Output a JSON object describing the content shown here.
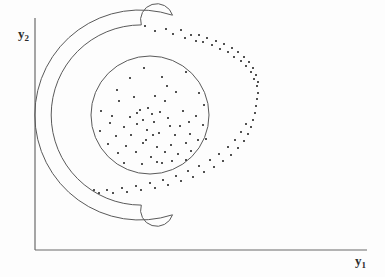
{
  "figure": {
    "background_color": "#fdfdfd",
    "line_color": "#4a4a4a",
    "point_color": "#2a2a2a"
  },
  "axes": {
    "y_axis_label": "y",
    "y_axis_subscript": "2",
    "x_axis_label": "y",
    "x_axis_subscript": "1",
    "x_axis": {
      "x1": 35,
      "y1": 250,
      "x2": 367,
      "y2": 250
    },
    "y_axis": {
      "x1": 35,
      "y1": 18,
      "x2": 35,
      "y2": 250
    }
  },
  "chart_data": {
    "type": "scatter",
    "title": "",
    "xlabel": "y1",
    "ylabel": "y2",
    "grid": false,
    "legend": "none",
    "xlim": [
      35,
      367
    ],
    "ylim": [
      18,
      250
    ],
    "annotations": [
      {
        "name": "inner-circle-boundary",
        "shape": "circle",
        "cx": 150,
        "cy": 115,
        "r": 59
      },
      {
        "name": "crescent-outer-boundary",
        "shape": "c-shape-band",
        "cx": 150,
        "cy": 115,
        "r_inner": 73,
        "r_outer": 105,
        "start_angle_deg": -72,
        "end_angle_deg": 72,
        "opening": "left"
      }
    ],
    "series": [
      {
        "name": "cluster-1-disk",
        "marker": "dot",
        "points": [
          [
            144,
            68
          ],
          [
            130,
            78
          ],
          [
            162,
            77
          ],
          [
            167,
            86
          ],
          [
            186,
            72
          ],
          [
            117,
            90
          ],
          [
            176,
            92
          ],
          [
            199,
            93
          ],
          [
            155,
            96
          ],
          [
            204,
            105
          ],
          [
            140,
            110
          ],
          [
            119,
            101
          ],
          [
            101,
            111
          ],
          [
            137,
            113
          ],
          [
            148,
            108
          ],
          [
            152,
            114
          ],
          [
            160,
            112
          ],
          [
            130,
            117
          ],
          [
            143,
            120
          ],
          [
            168,
            118
          ],
          [
            183,
            111
          ],
          [
            196,
            116
          ],
          [
            110,
            123
          ],
          [
            124,
            127
          ],
          [
            137,
            124
          ],
          [
            154,
            122
          ],
          [
            147,
            130
          ],
          [
            170,
            126
          ],
          [
            189,
            122
          ],
          [
            203,
            125
          ],
          [
            100,
            131
          ],
          [
            116,
            136
          ],
          [
            131,
            135
          ],
          [
            159,
            133
          ],
          [
            175,
            135
          ],
          [
            190,
            134
          ],
          [
            108,
            144
          ],
          [
            126,
            146
          ],
          [
            143,
            143
          ],
          [
            157,
            147
          ],
          [
            171,
            145
          ],
          [
            186,
            143
          ],
          [
            198,
            140
          ],
          [
            118,
            153
          ],
          [
            136,
            152
          ],
          [
            151,
            157
          ],
          [
            165,
            152
          ],
          [
            178,
            154
          ],
          [
            191,
            151
          ],
          [
            124,
            163
          ],
          [
            142,
            164
          ],
          [
            157,
            162
          ],
          [
            162,
            163
          ],
          [
            172,
            161
          ],
          [
            186,
            160
          ],
          [
            206,
            139
          ],
          [
            112,
            116
          ],
          [
            165,
            101
          ],
          [
            134,
            97
          ],
          [
            180,
            126
          ],
          [
            146,
            140
          ],
          [
            153,
            135
          ]
        ]
      },
      {
        "name": "cluster-2-crescent",
        "marker": "dot",
        "points": [
          [
            145,
            26
          ],
          [
            155,
            31
          ],
          [
            166,
            29
          ],
          [
            173,
            34
          ],
          [
            181,
            30
          ],
          [
            185,
            38
          ],
          [
            191,
            35
          ],
          [
            196,
            41
          ],
          [
            199,
            35
          ],
          [
            203,
            42
          ],
          [
            207,
            38
          ],
          [
            212,
            45
          ],
          [
            216,
            41
          ],
          [
            220,
            49
          ],
          [
            224,
            44
          ],
          [
            228,
            52
          ],
          [
            232,
            48
          ],
          [
            234,
            57
          ],
          [
            238,
            52
          ],
          [
            241,
            61
          ],
          [
            244,
            57
          ],
          [
            246,
            66
          ],
          [
            249,
            62
          ],
          [
            251,
            72
          ],
          [
            253,
            68
          ],
          [
            254,
            79
          ],
          [
            256,
            75
          ],
          [
            257,
            86
          ],
          [
            258,
            82
          ],
          [
            258,
            93
          ],
          [
            257,
            99
          ],
          [
            256,
            106
          ],
          [
            255,
            113
          ],
          [
            253,
            120
          ],
          [
            251,
            127
          ],
          [
            248,
            134
          ],
          [
            246,
            124
          ],
          [
            244,
            141
          ],
          [
            241,
            132
          ],
          [
            238,
            148
          ],
          [
            235,
            140
          ],
          [
            231,
            155
          ],
          [
            228,
            147
          ],
          [
            223,
            161
          ],
          [
            219,
            154
          ],
          [
            214,
            167
          ],
          [
            210,
            160
          ],
          [
            204,
            172
          ],
          [
            199,
            166
          ],
          [
            193,
            177
          ],
          [
            188,
            171
          ],
          [
            181,
            181
          ],
          [
            176,
            176
          ],
          [
            168,
            185
          ],
          [
            163,
            180
          ],
          [
            155,
            188
          ],
          [
            150,
            183
          ],
          [
            141,
            190
          ],
          [
            136,
            186
          ],
          [
            127,
            192
          ],
          [
            122,
            188
          ],
          [
            113,
            193
          ],
          [
            107,
            190
          ],
          [
            99,
            193
          ],
          [
            94,
            190
          ]
        ]
      }
    ]
  }
}
